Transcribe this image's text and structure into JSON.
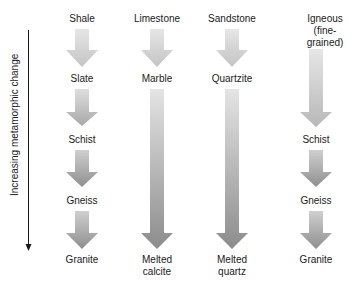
{
  "axis": {
    "label": "Increasing metamorphic change",
    "color": "#1a1a1a"
  },
  "colors": {
    "arrow_light": "#e2e2e2",
    "arrow_dark": "#8e8e8e",
    "text": "#1a1a1a"
  },
  "columns": [
    {
      "parent": "Shale",
      "stages": [
        "Slate",
        "Schist",
        "Gneiss",
        "Granite"
      ]
    },
    {
      "parent": "Limestone",
      "stages": [
        "Marble",
        "Melted calcite"
      ],
      "melted_line1": "Melted",
      "melted_line2": "calcite"
    },
    {
      "parent": "Sandstone",
      "stages": [
        "Quartzite",
        "Melted quartz"
      ],
      "melted_line1": "Melted",
      "melted_line2": "quartz"
    },
    {
      "parent": "Igneous (fine-grained)",
      "parent_line1": "Igneous",
      "parent_line2": "(fine-",
      "parent_line3": "grained)",
      "stages": [
        "Schist",
        "Gneiss",
        "Granite"
      ]
    }
  ]
}
